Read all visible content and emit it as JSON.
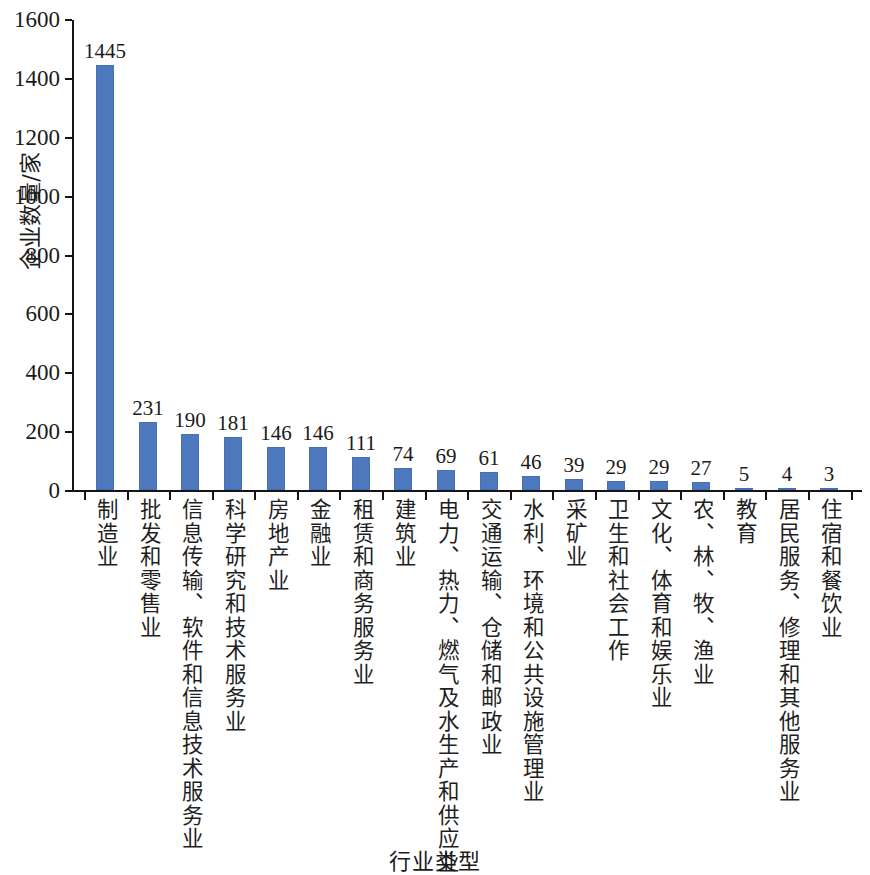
{
  "chart_data": {
    "type": "bar",
    "title": "",
    "xlabel": "行业类型",
    "ylabel": "企业数量/家",
    "ylim": [
      0,
      1600
    ],
    "ytick_labels": [
      "0",
      "200",
      "400",
      "600",
      "800",
      "1000",
      "1200",
      "1400",
      "1600"
    ],
    "yticks": [
      0,
      200,
      400,
      600,
      800,
      1000,
      1200,
      1400,
      1600
    ],
    "grid": false,
    "legend": null,
    "bar_color": "#4e79be",
    "categories": [
      "制造业",
      "批发和零售业",
      "信息传输、软件和信息技术服务业",
      "科学研究和技术服务业",
      "房地产业",
      "金融业",
      "租赁和商务服务业",
      "建筑业",
      "电力、热力、燃气及水生产和供应业",
      "交通运输、仓储和邮政业",
      "水利、环境和公共设施管理业",
      "采矿业",
      "卫生和社会工作",
      "文化、体育和娱乐业",
      "农、林、牧、渔业",
      "教育",
      "居民服务、修理和其他服务业",
      "住宿和餐饮业"
    ],
    "values": [
      1445,
      231,
      190,
      181,
      146,
      146,
      111,
      74,
      69,
      61,
      46,
      39,
      29,
      29,
      27,
      5,
      4,
      3
    ],
    "value_labels": [
      "1445",
      "231",
      "190",
      "181",
      "146",
      "146",
      "111",
      "74",
      "69",
      "61",
      "46",
      "39",
      "29",
      "29",
      "27",
      "5",
      "4",
      "3"
    ]
  }
}
